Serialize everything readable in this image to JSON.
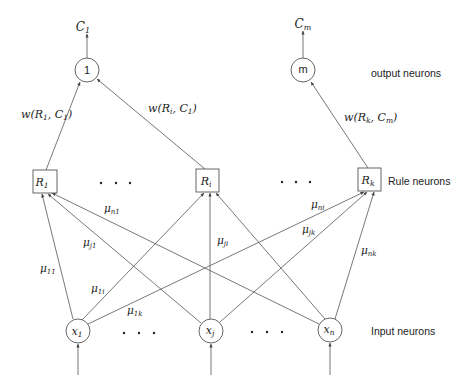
{
  "diagram": {
    "type": "fuzzy-neural-network",
    "colors": {
      "line": "#555555",
      "text": "#222222",
      "background": "#ffffff"
    },
    "layers": {
      "output": {
        "label": "output neurons"
      },
      "rule": {
        "label": "Rule neurons"
      },
      "input": {
        "label": "Input neurons"
      }
    },
    "output_nodes": [
      {
        "id": "1",
        "label": "1",
        "output_label": "C",
        "output_sub": "1"
      },
      {
        "id": "m",
        "label": "m",
        "output_label": "C",
        "output_sub": "m"
      }
    ],
    "rule_nodes": [
      {
        "id": "R1",
        "label": "R",
        "sub": "1"
      },
      {
        "id": "Ri",
        "label": "R",
        "sub": "i"
      },
      {
        "id": "Rk",
        "label": "R",
        "sub": "k"
      }
    ],
    "input_nodes": [
      {
        "id": "x1",
        "label": "x",
        "sub": "1"
      },
      {
        "id": "xj",
        "label": "x",
        "sub": "j"
      },
      {
        "id": "xn",
        "label": "x",
        "sub": "n"
      }
    ],
    "ellipsis": "• • •",
    "weight_labels": {
      "w_R1_C1": {
        "pre": "w(R",
        "sub1": "1",
        "mid": ", C",
        "sub2": "1",
        "post": ")"
      },
      "w_Ri_C1": {
        "pre": "w(R",
        "sub1": "i",
        "mid": ", C",
        "sub2": "1",
        "post": ")"
      },
      "w_Rk_Cm": {
        "pre": "w(R",
        "sub1": "k",
        "mid": ", C",
        "sub2": "m",
        "post": ")"
      }
    },
    "membership_labels": {
      "mu11": {
        "sym": "μ",
        "sub": "11"
      },
      "mu1i": {
        "sym": "μ",
        "sub": "1i"
      },
      "mu1k": {
        "sym": "μ",
        "sub": "1k"
      },
      "muj1": {
        "sym": "μ",
        "sub": "j1"
      },
      "muji": {
        "sym": "μ",
        "sub": "ji"
      },
      "mujk": {
        "sym": "μ",
        "sub": "jk"
      },
      "mun1": {
        "sym": "μ",
        "sub": "n1"
      },
      "muni": {
        "sym": "μ",
        "sub": "ni"
      },
      "munk": {
        "sym": "μ",
        "sub": "nk"
      }
    }
  }
}
